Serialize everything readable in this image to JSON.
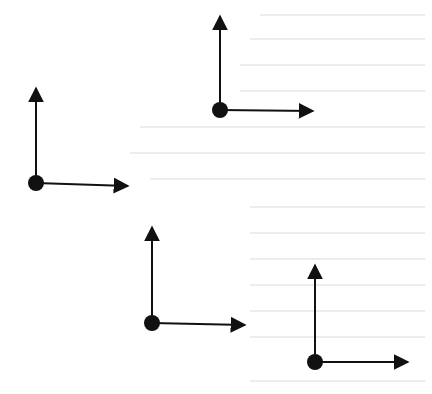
{
  "diagram": {
    "type": "coordinate-frames",
    "colors": {
      "stroke": "#111111",
      "origin": "#111111",
      "background": "#ffffff"
    },
    "frames": [
      {
        "id": "frame-a",
        "origin": [
          36,
          183
        ],
        "up_tip": [
          36,
          88
        ],
        "right_tip": [
          128,
          186
        ]
      },
      {
        "id": "frame-b",
        "origin": [
          220,
          110
        ],
        "up_tip": [
          220,
          16
        ],
        "right_tip": [
          313,
          111
        ]
      },
      {
        "id": "frame-c",
        "origin": [
          152,
          323
        ],
        "up_tip": [
          152,
          227
        ],
        "right_tip": [
          245,
          325
        ]
      },
      {
        "id": "frame-d",
        "origin": [
          315,
          362
        ],
        "up_tip": [
          315,
          265
        ],
        "right_tip": [
          408,
          362
        ]
      }
    ]
  }
}
